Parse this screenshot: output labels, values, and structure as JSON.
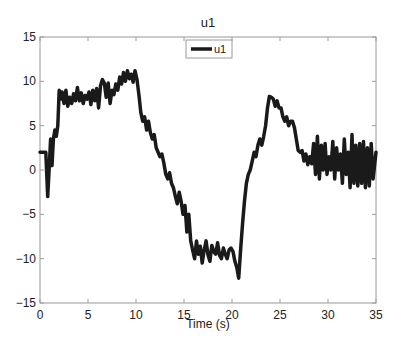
{
  "chart_data": {
    "type": "line",
    "title": "u1",
    "xlabel": "Time (s)",
    "ylabel": "",
    "xlim": [
      0,
      35
    ],
    "ylim": [
      -15,
      15
    ],
    "xticks": [
      0,
      5,
      10,
      15,
      20,
      25,
      30,
      35
    ],
    "yticks": [
      -15,
      -10,
      -5,
      0,
      5,
      10,
      15
    ],
    "grid": false,
    "legend": {
      "position": "top-center",
      "entries": [
        "u1"
      ]
    },
    "series": [
      {
        "name": "u1",
        "color": "#1a1a1a",
        "x": [
          0,
          0.6,
          0.8,
          0.95,
          1.1,
          1.25,
          1.4,
          1.55,
          1.7,
          1.85,
          2.0,
          2.15,
          2.3,
          2.5,
          2.7,
          2.9,
          3.1,
          3.3,
          3.5,
          3.7,
          3.9,
          4.1,
          4.3,
          4.5,
          4.7,
          4.9,
          5.1,
          5.3,
          5.5,
          5.7,
          5.9,
          6.1,
          6.3,
          6.5,
          6.7,
          6.9,
          7.1,
          7.3,
          7.5,
          7.7,
          7.9,
          8.1,
          8.3,
          8.5,
          8.7,
          8.9,
          9.1,
          9.3,
          9.5,
          9.7,
          9.9,
          10.1,
          10.3,
          10.5,
          10.7,
          10.9,
          11.1,
          11.3,
          11.5,
          11.7,
          11.9,
          12.1,
          12.3,
          12.5,
          12.7,
          12.9,
          13.1,
          13.3,
          13.5,
          13.7,
          13.9,
          14.1,
          14.3,
          14.5,
          14.7,
          14.9,
          15.1,
          15.3,
          15.5,
          15.7,
          15.9,
          16.1,
          16.3,
          16.5,
          16.7,
          16.9,
          17.1,
          17.3,
          17.5,
          17.7,
          17.9,
          18.1,
          18.3,
          18.5,
          18.7,
          18.9,
          19.1,
          19.3,
          19.5,
          19.7,
          19.9,
          20.1,
          20.3,
          20.5,
          20.7,
          20.9,
          21.1,
          21.3,
          21.5,
          21.7,
          21.9,
          22.1,
          22.3,
          22.5,
          22.7,
          22.9,
          23.1,
          23.3,
          23.5,
          23.7,
          23.9,
          24.1,
          24.3,
          24.5,
          24.7,
          24.9,
          25.1,
          25.3,
          25.5,
          25.7,
          25.9,
          26.1,
          26.3,
          26.5,
          26.7,
          26.9,
          27.1,
          27.3,
          27.5,
          27.7,
          27.9,
          28.1,
          28.3,
          28.5,
          28.7,
          28.9,
          29.1,
          29.3,
          29.5,
          29.7,
          29.9,
          30.1,
          30.3,
          30.5,
          30.7,
          30.9,
          31.1,
          31.3,
          31.5,
          31.7,
          31.9,
          32.1,
          32.3,
          32.5,
          32.7,
          32.9,
          33.1,
          33.3,
          33.5,
          33.7,
          33.9,
          34.1,
          34.3,
          34.5,
          34.7,
          35.0
        ],
        "y": [
          2,
          2,
          -3,
          0,
          3.5,
          0.5,
          3.5,
          4.5,
          3.8,
          5,
          9,
          8,
          8.8,
          7.5,
          9,
          7.2,
          8.2,
          7.5,
          8.6,
          7.8,
          9.3,
          7.8,
          8.7,
          7.5,
          8.4,
          8,
          8.8,
          7.4,
          9,
          7.8,
          9.2,
          7,
          9.5,
          10.2,
          9.8,
          8.2,
          9.8,
          7.5,
          9,
          8.5,
          9.7,
          9,
          10.5,
          9.7,
          11,
          10,
          11.2,
          10.3,
          10.8,
          9.9,
          11.2,
          10.2,
          8.5,
          6.5,
          5.5,
          6,
          4.5,
          5.5,
          4.2,
          3.5,
          4,
          2.5,
          2,
          1.5,
          1.8,
          0.8,
          -0.5,
          -1,
          -0.3,
          -1.5,
          -2,
          -3,
          -3.8,
          -2.5,
          -3.5,
          -5,
          -4,
          -7,
          -5,
          -8,
          -9,
          -10,
          -8,
          -9.5,
          -8.6,
          -10.5,
          -9,
          -8,
          -9.6,
          -10.3,
          -8.5,
          -9.2,
          -9.5,
          -8.2,
          -9.6,
          -10,
          -8.8,
          -9.5,
          -10,
          -9,
          -8.8,
          -9.2,
          -10.3,
          -11,
          -12.2,
          -9,
          -6,
          -3.5,
          -1.5,
          -0.5,
          0,
          1,
          2,
          1.5,
          2.8,
          3.5,
          2.8,
          3.8,
          5,
          7,
          8.3,
          8.2,
          8,
          7.2,
          7.8,
          7,
          7,
          6,
          5.5,
          6,
          5,
          5.5,
          5.5,
          4.8,
          3.5,
          2.2,
          2,
          2.2,
          1,
          1.8,
          0.6,
          1.5,
          0.7,
          3,
          -0.5,
          3.8,
          -1,
          2.8,
          0,
          3,
          -0.5,
          1.5,
          0,
          3.2,
          -1,
          2.5,
          0,
          1.8,
          -1.5,
          3.5,
          -0.5,
          2,
          -2,
          4,
          -1.5,
          2.8,
          -1.8,
          3,
          -1.5,
          3.2,
          -2,
          2.5,
          -1.8,
          3,
          -1,
          2
        ]
      }
    ]
  },
  "figure": {
    "title": "u1",
    "xlabel": "Time (s)",
    "legend_label": "u1",
    "ytick_labels": [
      "15",
      "10",
      "5",
      "0",
      "−5",
      "−10",
      "−15"
    ],
    "xtick_labels": [
      "0",
      "5",
      "10",
      "15",
      "20",
      "25",
      "30",
      "35"
    ]
  }
}
